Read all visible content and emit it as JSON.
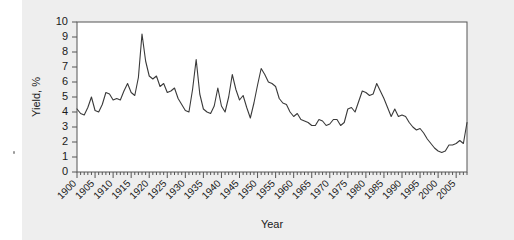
{
  "figure": {
    "background_color": "#eeeeee",
    "plot_background_color": "#ffffff",
    "frame_color": "#555555",
    "line_color": "#3a3a3a"
  },
  "chart_data": {
    "type": "line",
    "title": "",
    "xlabel": "Year",
    "ylabel": "Yield, %",
    "xlim": [
      1900,
      2008
    ],
    "ylim": [
      0,
      10
    ],
    "grid": false,
    "legend": null,
    "x_major_ticks": [
      1900,
      1905,
      1910,
      1915,
      1920,
      1925,
      1930,
      1935,
      1940,
      1945,
      1950,
      1955,
      1960,
      1965,
      1970,
      1975,
      1980,
      1985,
      1990,
      1995,
      2000,
      2005
    ],
    "x_minor_tick_interval": 1,
    "y_ticks": [
      0,
      1,
      2,
      3,
      4,
      5,
      6,
      7,
      8,
      9,
      10
    ],
    "x_tick_label_rotation_deg": 45,
    "series": [
      {
        "name": "Yield",
        "x": [
          1900,
          1901,
          1902,
          1903,
          1904,
          1905,
          1906,
          1907,
          1908,
          1909,
          1910,
          1911,
          1912,
          1913,
          1914,
          1915,
          1916,
          1917,
          1918,
          1919,
          1920,
          1921,
          1922,
          1923,
          1924,
          1925,
          1926,
          1927,
          1928,
          1929,
          1930,
          1931,
          1932,
          1933,
          1934,
          1935,
          1936,
          1937,
          1938,
          1939,
          1940,
          1941,
          1942,
          1943,
          1944,
          1945,
          1946,
          1947,
          1948,
          1949,
          1950,
          1951,
          1952,
          1953,
          1954,
          1955,
          1956,
          1957,
          1958,
          1959,
          1960,
          1961,
          1962,
          1963,
          1964,
          1965,
          1966,
          1967,
          1968,
          1969,
          1970,
          1971,
          1972,
          1973,
          1974,
          1975,
          1976,
          1977,
          1978,
          1979,
          1980,
          1981,
          1982,
          1983,
          1984,
          1985,
          1986,
          1987,
          1988,
          1989,
          1990,
          1991,
          1992,
          1993,
          1994,
          1995,
          1996,
          1997,
          1998,
          1999,
          2000,
          2001,
          2002,
          2003,
          2004,
          2005,
          2006,
          2007,
          2008
        ],
        "values": [
          4.2,
          3.9,
          3.8,
          4.3,
          5.0,
          4.1,
          4.0,
          4.5,
          5.3,
          5.2,
          4.8,
          4.9,
          4.8,
          5.4,
          5.9,
          5.3,
          5.1,
          6.3,
          9.2,
          7.4,
          6.4,
          6.2,
          6.4,
          5.7,
          5.9,
          5.3,
          5.4,
          5.6,
          4.9,
          4.5,
          4.1,
          4.0,
          5.5,
          7.5,
          5.2,
          4.2,
          4.0,
          3.9,
          4.4,
          5.6,
          4.4,
          4.0,
          5.0,
          6.5,
          5.5,
          4.8,
          5.1,
          4.3,
          3.6,
          4.6,
          5.8,
          6.9,
          6.5,
          6.0,
          5.9,
          5.7,
          4.9,
          4.6,
          4.5,
          4.0,
          3.7,
          3.9,
          3.5,
          3.4,
          3.3,
          3.1,
          3.1,
          3.5,
          3.4,
          3.1,
          3.2,
          3.5,
          3.5,
          3.1,
          3.3,
          4.2,
          4.3,
          4.0,
          4.7,
          5.4,
          5.3,
          5.1,
          5.2,
          5.9,
          5.4,
          4.9,
          4.3,
          3.7,
          4.2,
          3.7,
          3.8,
          3.7,
          3.3,
          3.0,
          2.8,
          2.9,
          2.6,
          2.2,
          1.9,
          1.6,
          1.4,
          1.3,
          1.4,
          1.8,
          1.8,
          1.9,
          2.1,
          1.9,
          3.3
        ]
      }
    ]
  }
}
